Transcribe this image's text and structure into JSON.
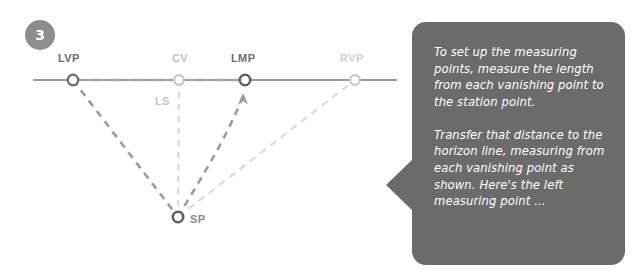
{
  "page": {
    "background_color": "#ffffff",
    "width": 640,
    "height": 280
  },
  "diagram": {
    "step_number": "3",
    "colors": {
      "horizon_line": "#9a9a9a",
      "dark_guide": "#8e8e8e",
      "light_guide": "#d8d8d8",
      "badge": "#8d8d8d",
      "callout": "#6b6b6b",
      "callout_text": "#ffffff"
    },
    "labels": {
      "lvp": "LVP",
      "cv": "CV",
      "lmp": "LMP",
      "rvp": "RVP",
      "ls": "LS",
      "sp": "SP"
    },
    "points": [
      {
        "id": "lvp",
        "label": "LVP",
        "x": 73,
        "y": 80,
        "tone": "dark"
      },
      {
        "id": "cv",
        "label": "CV",
        "x": 179,
        "y": 80,
        "tone": "light"
      },
      {
        "id": "lmp",
        "label": "LMP",
        "x": 245,
        "y": 80,
        "tone": "dark"
      },
      {
        "id": "rvp",
        "label": "RVP",
        "x": 355,
        "y": 80,
        "tone": "light"
      },
      {
        "id": "sp",
        "label": "SP",
        "x": 178,
        "y": 217,
        "tone": "dark"
      }
    ],
    "horizon_line": {
      "x1": 33,
      "x2": 397,
      "y": 80
    },
    "arrow": {
      "label": "measure-direction-arrow",
      "x": 243,
      "y": 99,
      "direction": "up"
    }
  },
  "callout": {
    "paragraphs": [
      "To set up the measuring points, measure the length from each vanishing point to the station point.",
      "Transfer that distance to the horizon line, measuring from each vanishing point as shown. Here's the left measuring point ..."
    ]
  }
}
